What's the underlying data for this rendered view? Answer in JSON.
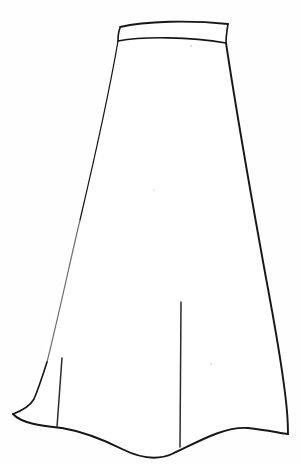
{
  "document": {
    "title": "Skirt Technical Line Drawing",
    "background_color": "#fefefe",
    "ink_color": "#16161a",
    "canvas_width": 301,
    "canvas_height": 465
  },
  "figure": {
    "view": "front",
    "style": "technical flat line drawing",
    "parts": [
      {
        "id": "waistband",
        "label": "Waistband"
      },
      {
        "id": "skirt-body",
        "label": "Skirt Body"
      },
      {
        "id": "left-seam",
        "label": "Left Seam / Slit"
      },
      {
        "id": "center-seam",
        "label": "Center Front Seam / Slit"
      },
      {
        "id": "hemline",
        "label": "Hemline"
      }
    ]
  },
  "geometry": {
    "waistband": {
      "top_left": [
        120,
        27
      ],
      "top_right": [
        228,
        24
      ],
      "bottom_right": [
        226,
        43
      ],
      "bottom_left": [
        118,
        40
      ],
      "top_path": "M120,27 C145,21 190,20 228,24",
      "bottom_path": "M118,41 C145,36 190,37 226,43"
    },
    "skirt_body": {
      "left_edge_path": "M118,41 C101,130 57,300 34,398 L13,414",
      "right_edge_path": "M226,43 C240,110 268,290 285,392 L288,434",
      "hem_path": "M13,414 C30,427 70,432 112,447 C138,458 152,461 170,455 C196,444 225,427 250,429 C268,430 280,433 288,434"
    },
    "left_seam": {
      "from": [
        62,
        358
      ],
      "to": [
        57,
        427
      ]
    },
    "center_seam": {
      "from": [
        181,
        302
      ],
      "to": [
        180,
        447
      ]
    },
    "specks": [
      {
        "x": 191,
        "y": 46,
        "r": 1.1
      },
      {
        "x": 211,
        "y": 364,
        "r": 1.0
      },
      {
        "x": 154,
        "y": 190,
        "r": 0.8
      }
    ]
  },
  "annotations": {
    "caption": "",
    "legend": []
  }
}
